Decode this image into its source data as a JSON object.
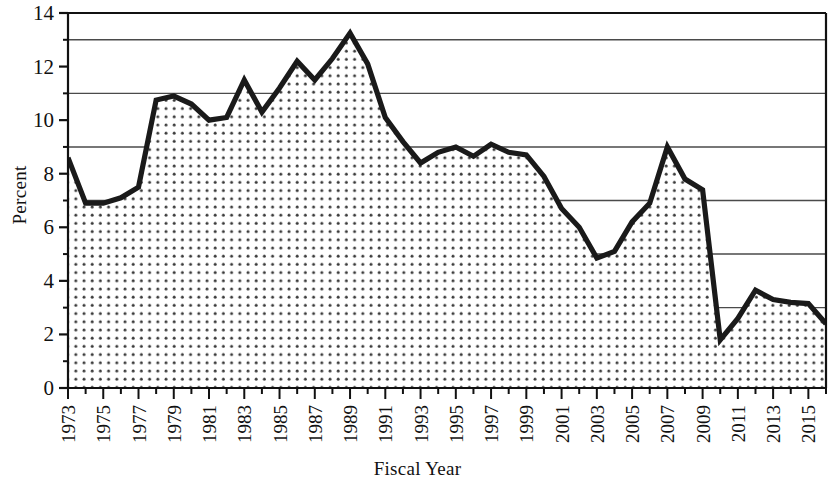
{
  "chart_data": {
    "type": "area",
    "title": "",
    "xlabel": "Fiscal Year",
    "ylabel": "Percent",
    "ylim": [
      0,
      14
    ],
    "xlim": [
      1973,
      2016
    ],
    "grid": "horizontal-minor-odd",
    "legend": "none",
    "y_ticks_major": [
      0,
      2,
      4,
      6,
      8,
      10,
      12,
      14
    ],
    "y_ticks_minor": [
      1,
      3,
      5,
      7,
      9,
      11,
      13
    ],
    "x_tick_labels": [
      "1973",
      "1975",
      "1977",
      "1979",
      "1981",
      "1983",
      "1985",
      "1987",
      "1989",
      "1991",
      "1993",
      "1995",
      "1997",
      "1999",
      "2001",
      "2003",
      "2005",
      "2007",
      "2009",
      "2011",
      "2013",
      "2015"
    ],
    "x": [
      1973,
      1974,
      1975,
      1976,
      1977,
      1978,
      1979,
      1980,
      1981,
      1982,
      1983,
      1984,
      1985,
      1986,
      1987,
      1988,
      1989,
      1990,
      1991,
      1992,
      1993,
      1994,
      1995,
      1996,
      1997,
      1998,
      1999,
      2000,
      2001,
      2002,
      2003,
      2004,
      2005,
      2006,
      2007,
      2008,
      2009,
      2010,
      2011,
      2012,
      2013,
      2014,
      2015,
      2016
    ],
    "values": [
      8.6,
      6.9,
      6.9,
      7.1,
      7.5,
      10.75,
      10.9,
      10.6,
      10.0,
      10.1,
      11.5,
      10.3,
      11.2,
      12.2,
      11.5,
      12.3,
      13.25,
      12.1,
      10.1,
      9.2,
      8.4,
      8.8,
      9.0,
      8.65,
      9.1,
      8.8,
      8.7,
      7.9,
      6.7,
      6.0,
      4.85,
      5.1,
      6.2,
      6.9,
      9.0,
      7.8,
      7.4,
      1.8,
      2.6,
      3.65,
      3.3,
      3.2,
      3.15,
      2.4
    ],
    "colors": {
      "line": "#1a1a1a",
      "fill_dots": "#3a3a3a",
      "background": "#ffffff",
      "gridline": "#4a4a4a",
      "axis": "#111111"
    }
  }
}
